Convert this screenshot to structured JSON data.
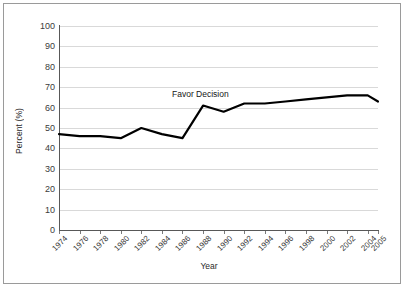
{
  "chart_data": {
    "type": "line",
    "title": "",
    "xlabel": "Year",
    "ylabel": "Percent (%)",
    "ylim": [
      0,
      100
    ],
    "ytick_step": 10,
    "grid": true,
    "legend": "none",
    "annotations": [
      {
        "text": "Favor Decision",
        "x": 1988,
        "y": 70
      }
    ],
    "categories": [
      "1974",
      "1976",
      "1978",
      "1980",
      "1982",
      "1984",
      "1986",
      "1988",
      "1990",
      "1992",
      "1994",
      "1996",
      "1998",
      "2000",
      "2002",
      "2004",
      "2005"
    ],
    "yticks": [
      "0",
      "10",
      "20",
      "30",
      "40",
      "50",
      "60",
      "70",
      "80",
      "90",
      "100"
    ],
    "series": [
      {
        "name": "Favor Decision",
        "color": "#000000",
        "x": [
          1974,
          1976,
          1978,
          1980,
          1982,
          1984,
          1986,
          1988,
          1990,
          1992,
          1994,
          1996,
          1998,
          2000,
          2002,
          2004,
          2005
        ],
        "values": [
          47,
          46,
          46,
          45,
          50,
          47,
          45,
          61,
          58,
          62,
          62,
          63,
          64,
          65,
          66,
          66,
          63
        ]
      }
    ]
  },
  "axis": {
    "ylabel": "Percent (%)",
    "xlabel": "Year"
  }
}
